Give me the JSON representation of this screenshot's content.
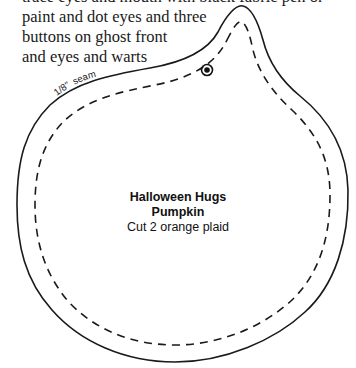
{
  "instructions": {
    "lines": [
      "trace eyes and mouth with black fabric pen or",
      "paint and dot eyes and three",
      "buttons on ghost front",
      "and eyes and warts"
    ]
  },
  "pattern": {
    "seam_label": "1/8\" seam",
    "seam_fraction": "1/8\"",
    "seam_word": "seam",
    "piece_title_line1": "Halloween Hugs",
    "piece_title_line2": "Pumpkin",
    "cut_instruction": "Cut 2 orange plaid",
    "marker_icon": "button-placement-mark",
    "colors": {
      "outline": "#1a1a1a",
      "background": "#ffffff"
    }
  }
}
